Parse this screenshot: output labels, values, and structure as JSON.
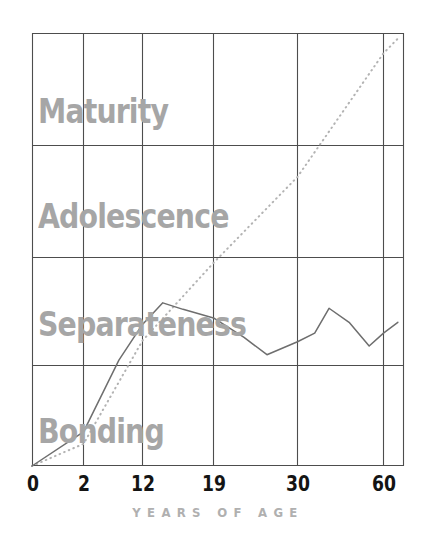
{
  "chart_data": {
    "type": "line",
    "title": "",
    "subtitle": "",
    "xlabel": "YEARS OF AGE",
    "ylabel": "",
    "grid": true,
    "legend_position": "none",
    "xlim": [
      0,
      65
    ],
    "ylim": [
      0,
      4
    ],
    "x_tick_labels": [
      "0",
      "2",
      "12",
      "19",
      "30",
      "60"
    ],
    "x_tick_values": [
      0,
      2,
      12,
      19,
      30,
      60
    ],
    "y_band_labels": [
      "Bonding",
      "Separateness",
      "Adolescence",
      "Maturity"
    ],
    "y_band_bounds": [
      0,
      1,
      2,
      3,
      4
    ],
    "annotations": [
      {
        "text": "Maturity",
        "band": 4
      },
      {
        "text": "Adolescence",
        "band": 3
      },
      {
        "text": "Separateness",
        "band": 2
      },
      {
        "text": "Bonding",
        "band": 1
      }
    ],
    "series": [
      {
        "name": "dotted-trend",
        "style": "dotted",
        "color": "#b3b3b3",
        "x": [
          0,
          2,
          12,
          19,
          30,
          60,
          65
        ],
        "y": [
          0.0,
          0.22,
          1.23,
          1.95,
          2.72,
          3.82,
          3.95
        ]
      },
      {
        "name": "solid-observed",
        "style": "solid",
        "color": "#6e6e6e",
        "x": [
          0,
          2,
          8,
          12,
          14,
          16,
          19,
          23,
          26,
          30,
          36,
          41,
          48,
          55,
          60,
          65
        ],
        "y": [
          0.0,
          0.34,
          1.05,
          1.38,
          1.58,
          1.52,
          1.44,
          1.26,
          1.1,
          1.22,
          1.3,
          1.53,
          1.4,
          1.18,
          1.3,
          1.4
        ]
      }
    ]
  },
  "axis": {
    "caption": "YEARS OF AGE",
    "ticks": [
      {
        "label": "0"
      },
      {
        "label": "2"
      },
      {
        "label": "12"
      },
      {
        "label": "19"
      },
      {
        "label": "30"
      },
      {
        "label": "60"
      }
    ]
  },
  "bands": {
    "maturity": "Maturity",
    "adolescence": "Adolescence",
    "separateness": "Separateness",
    "bonding": "Bonding"
  },
  "colors": {
    "band_label": "#a6a6a6",
    "tick_label": "#141414",
    "caption": "#b0b0b0",
    "grid": "#4d4d4d",
    "solid_line": "#6e6e6e",
    "dotted_line": "#b3b3b3",
    "background": "#ffffff"
  }
}
